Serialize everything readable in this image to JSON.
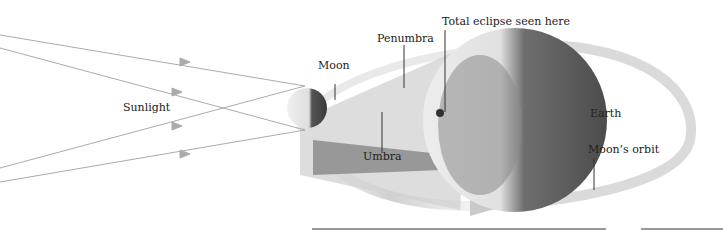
{
  "diagram": {
    "labels": {
      "sunlight": "Sunlight",
      "moon": "Moon",
      "penumbra": "Penumbra",
      "total_eclipse": "Total eclipse seen here",
      "earth": "Earth",
      "umbra": "Umbra",
      "moons_orbit": "Moon’s orbit"
    },
    "colors": {
      "sun_rays": "#a8a8a8",
      "penumbra": "#cfcfcf",
      "umbra": "#8f8f8f",
      "earth_light": "#e9e9e9",
      "earth_dark": "#5a5a5a",
      "orbit": "#d6d6d6",
      "leader_lines": "#333333"
    }
  }
}
